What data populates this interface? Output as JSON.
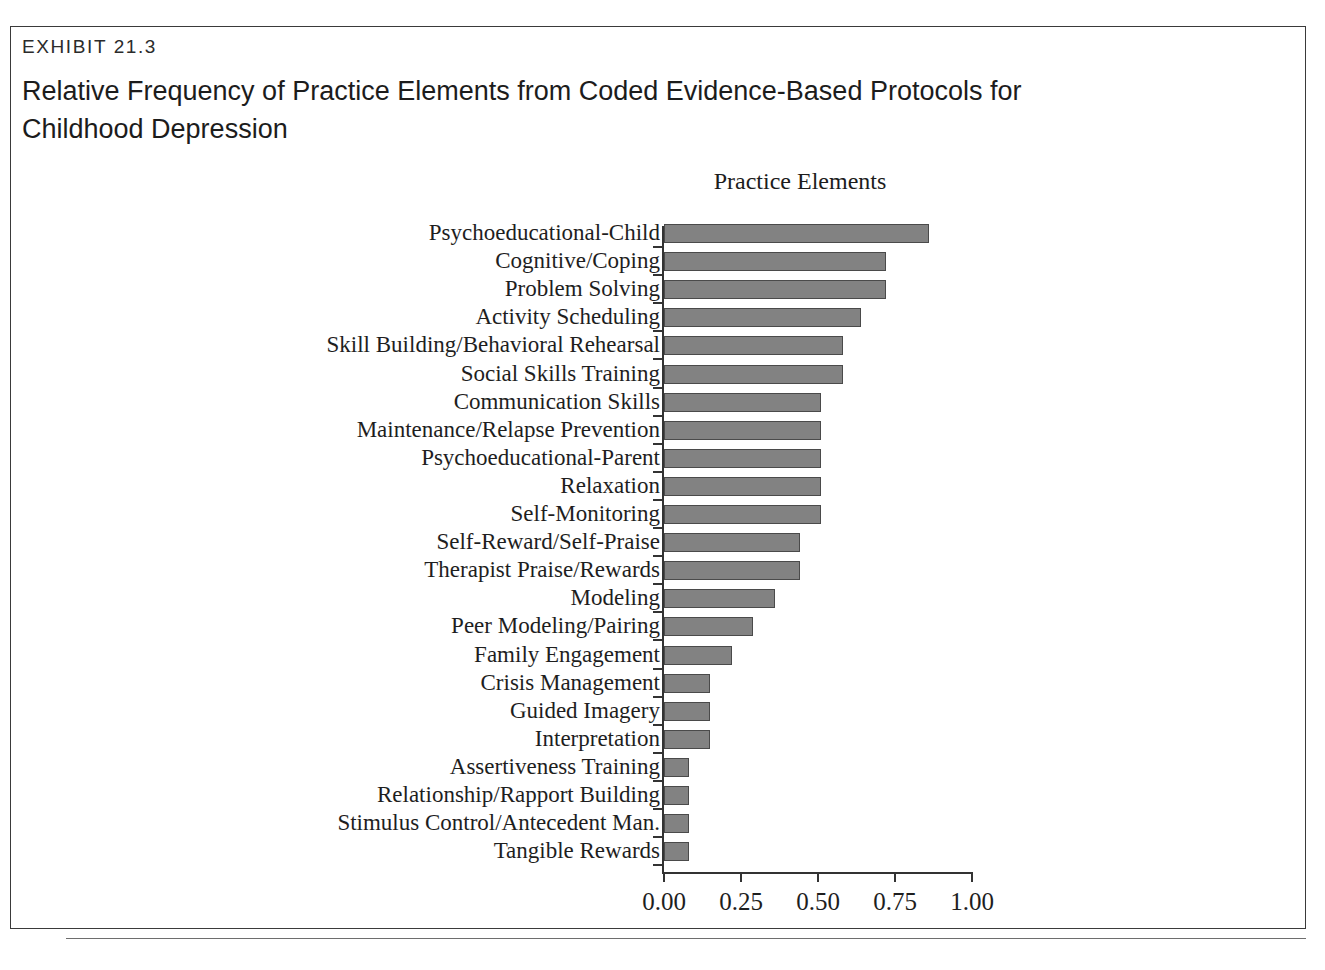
{
  "exhibit": {
    "number": "EXHIBIT 21.3",
    "title": "Relative Frequency of Practice Elements from Coded Evidence-Based Protocols for Childhood Depression"
  },
  "chart_data": {
    "type": "bar",
    "orientation": "horizontal",
    "title": "Practice Elements",
    "xlabel": "",
    "ylabel": "",
    "xlim": [
      0.0,
      1.0
    ],
    "grid": false,
    "legend": null,
    "xticks": [
      "0.00",
      "0.25",
      "0.50",
      "0.75",
      "1.00"
    ],
    "xtick_values": [
      0.0,
      0.25,
      0.5,
      0.75,
      1.0
    ],
    "categories": [
      "Psychoeducational-Child",
      "Cognitive/Coping",
      "Problem Solving",
      "Activity Scheduling",
      "Skill Building/Behavioral Rehearsal",
      "Social Skills Training",
      "Communication Skills",
      "Maintenance/Relapse Prevention",
      "Psychoeducational-Parent",
      "Relaxation",
      "Self-Monitoring",
      "Self-Reward/Self-Praise",
      "Therapist Praise/Rewards",
      "Modeling",
      "Peer Modeling/Pairing",
      "Family Engagement",
      "Crisis Management",
      "Guided Imagery",
      "Interpretation",
      "Assertiveness Training",
      "Relationship/Rapport Building",
      "Stimulus Control/Antecedent Man.",
      "Tangible Rewards"
    ],
    "values": [
      0.86,
      0.72,
      0.72,
      0.64,
      0.58,
      0.58,
      0.51,
      0.51,
      0.51,
      0.51,
      0.51,
      0.44,
      0.44,
      0.36,
      0.29,
      0.22,
      0.15,
      0.15,
      0.15,
      0.08,
      0.08,
      0.08,
      0.08
    ],
    "bar_color": "#828282",
    "bar_edge_color": "#4a4a4a"
  }
}
